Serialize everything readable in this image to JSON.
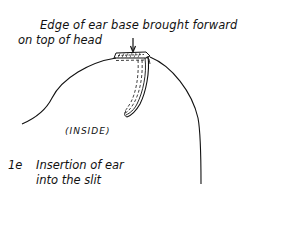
{
  "diagram": {
    "annotation": {
      "line1": "Edge of ear base brought forward",
      "line2": "on top of head"
    },
    "inside_label": "(INSIDE)",
    "figure": {
      "number": "1e",
      "caption_line1": "Insertion of ear",
      "caption_line2": "into the slit"
    },
    "elements": [
      "head-outline",
      "ear-base-edge",
      "ear-flap-in-slit",
      "pointer-arrow"
    ]
  }
}
